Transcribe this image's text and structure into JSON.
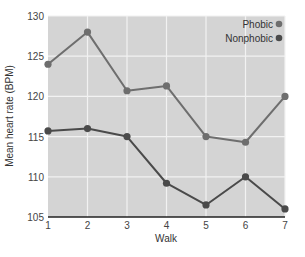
{
  "chart_data": {
    "type": "line",
    "title": "",
    "xlabel": "Walk",
    "ylabel": "Mean heart rate (BPM)",
    "x": [
      1,
      2,
      3,
      4,
      5,
      6,
      7
    ],
    "categories": [
      "1",
      "2",
      "3",
      "4",
      "5",
      "6",
      "7"
    ],
    "ylim": [
      105,
      130
    ],
    "yticks": [
      105,
      110,
      115,
      120,
      125,
      130
    ],
    "grid": true,
    "legend_position": "top-right",
    "series": [
      {
        "name": "Phobic",
        "color": "#6e6e6e",
        "values": [
          124,
          128,
          120.7,
          121.3,
          115,
          114.3,
          120
        ]
      },
      {
        "name": "Nonphobic",
        "color": "#4a4a4a",
        "values": [
          115.7,
          116,
          115,
          109.2,
          106.5,
          110,
          106
        ]
      }
    ]
  },
  "style": {
    "plot_bg": "#d4d4d4",
    "grid_color": "#f2f2f2",
    "axis_color": "#222222"
  }
}
